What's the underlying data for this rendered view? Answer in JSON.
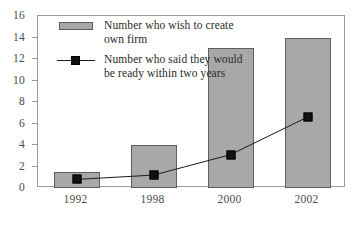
{
  "chart_data": {
    "type": "bar",
    "title": "",
    "xlabel": "",
    "ylabel": "",
    "categories": [
      "1992",
      "1998",
      "2000",
      "2002"
    ],
    "ylim": [
      0,
      16
    ],
    "ytick_labels": [
      "0",
      "2",
      "4",
      "6",
      "8",
      "10",
      "12",
      "14",
      "16"
    ],
    "ytick_values": [
      0,
      2,
      4,
      6,
      8,
      10,
      12,
      14,
      16
    ],
    "grid": false,
    "legend_position": "upper-left-inside",
    "series": [
      {
        "name": "Number who wish to create own firm",
        "type": "bar",
        "color": "#a8a8a8",
        "values": [
          1.5,
          4,
          13,
          14
        ]
      },
      {
        "name": "Number who said they would be ready within two years",
        "type": "line",
        "color": "#111111",
        "marker": "square",
        "values": [
          0.8,
          1.2,
          3.1,
          6.6
        ]
      }
    ]
  },
  "legend": {
    "entries": [
      {
        "label": "Number who wish to create own firm",
        "key": "bar-swatch"
      },
      {
        "label": "Number who said they would be ready within two years",
        "key": "line-marker"
      }
    ]
  },
  "colors": {
    "bar_fill": "#a8a8a8",
    "bar_edge": "#5e5e5e",
    "marker_fill": "#111111",
    "line": "#1a1a1a",
    "axis": "#9a9a9a",
    "tick_text": "#4c4c4c",
    "background": "#ffffff"
  }
}
